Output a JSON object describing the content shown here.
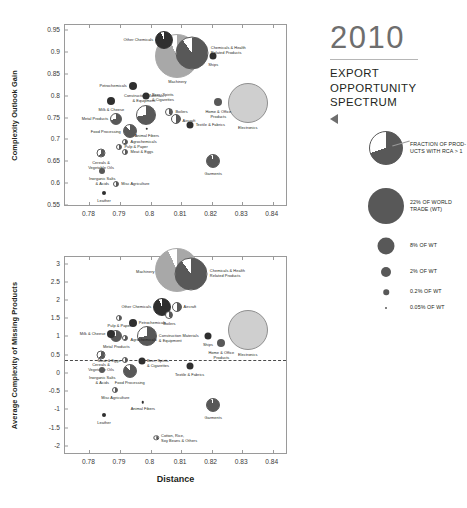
{
  "panel": {
    "year": "2010",
    "subtitle_lines": [
      "EXPORT",
      "OPPORTUNITY",
      "SPECTRUM"
    ],
    "arrow_icon": "triangle-left-icon"
  },
  "legend": {
    "items": [
      {
        "label": "FRACTION OF PROD-\nUCTS WITH RCA > 1",
        "kind": "pie",
        "size": 34
      },
      {
        "label": "22% OF WORLD\nTRADE (WT)",
        "kind": "circle",
        "size": 36
      },
      {
        "label": "8% OF WT",
        "kind": "circle",
        "size": 17
      },
      {
        "label": "2% OF WT",
        "kind": "circle",
        "size": 10
      },
      {
        "label": "0.2% OF WT",
        "kind": "circle",
        "size": 5.5
      },
      {
        "label": "0.05% OF WT",
        "kind": "circle",
        "size": 2
      }
    ]
  },
  "colors": {
    "dark": "#2f2f2f",
    "mid": "#585858",
    "light": "#a8a8a8",
    "pale": "#cfcfcf",
    "axis": "#9a9a9a",
    "text": "#231f20",
    "year": "#6e6e6e"
  },
  "chart_data": [
    {
      "type": "scatter",
      "id": "complexity-outlook-gain",
      "title": "",
      "xlabel": "",
      "ylabel": "Complexity Outlook Gain",
      "xlim": [
        0.772,
        0.845
      ],
      "ylim": [
        0.545,
        0.962
      ],
      "xticks": [
        0.78,
        0.79,
        0.8,
        0.81,
        0.82,
        0.83,
        0.84
      ],
      "xticklabels": [
        "0.78",
        "0.79",
        "0.8",
        "0.81",
        "0.82",
        "0.83",
        "0.84"
      ],
      "yticks": [
        0.55,
        0.6,
        0.65,
        0.7,
        0.75,
        0.8,
        0.85,
        0.9,
        0.95
      ],
      "yticklabels": [
        "0.55",
        "0.6",
        "0.65",
        "0.7",
        "0.75",
        "0.8",
        "0.85",
        "0.9",
        "0.95"
      ],
      "grid": false,
      "legend": "right",
      "points": [
        {
          "name": "Other Chemicals",
          "x": 0.8045,
          "y": 0.9285,
          "size": 18,
          "frac": 0.94,
          "shade": "dark",
          "lpos": "lt",
          "ldx": -11,
          "ldy": 0
        },
        {
          "name": "Machinery",
          "x": 0.8088,
          "y": 0.8915,
          "size": 44,
          "frac": 0.93,
          "shade": "light",
          "lpos": "bt",
          "ldx": 0,
          "ldy": 24
        },
        {
          "name": "Chemicals & Health\nRelated Products",
          "x": 0.8135,
          "y": 0.8985,
          "size": 33,
          "frac": 0.9,
          "shade": "mid",
          "lpos": "rt",
          "ldx": 19,
          "ldy": -2
        },
        {
          "name": "Ships",
          "x": 0.8205,
          "y": 0.8905,
          "size": 7,
          "frac": 1.0,
          "shade": "dark",
          "lpos": "bt",
          "ldx": 0,
          "ldy": 7
        },
        {
          "name": "Petrochemicals",
          "x": 0.7942,
          "y": 0.8225,
          "size": 8,
          "frac": 1.0,
          "shade": "dark",
          "lpos": "lt",
          "ldx": -6,
          "ldy": 0
        },
        {
          "name": "Beer, Spirits\n& Cigarettes",
          "x": 0.7985,
          "y": 0.7985,
          "size": 7,
          "frac": 1.0,
          "shade": "dark",
          "lpos": "rt",
          "ldx": 6,
          "ldy": 2
        },
        {
          "name": "Home & Office\nProducts",
          "x": 0.8222,
          "y": 0.7845,
          "size": 8,
          "frac": 1.0,
          "shade": "mid",
          "lpos": "bt",
          "ldx": 0,
          "ldy": 8
        },
        {
          "name": "Electronics",
          "x": 0.8318,
          "y": 0.7825,
          "size": 40,
          "frac": 1.0,
          "shade": "pale",
          "lpos": "bt",
          "ldx": 0,
          "ldy": 23
        },
        {
          "name": "Milk & Cheese",
          "x": 0.7872,
          "y": 0.7872,
          "size": 8,
          "frac": 1.0,
          "shade": "dark",
          "lpos": "bt",
          "ldx": 0,
          "ldy": 7
        },
        {
          "name": "Construction Materials\n& Equipment",
          "x": 0.7985,
          "y": 0.7555,
          "size": 20,
          "frac": 0.72,
          "shade": "mid",
          "lpos": "tp",
          "ldx": -2,
          "ldy": -11
        },
        {
          "name": "Boilers",
          "x": 0.8062,
          "y": 0.7638,
          "size": 8,
          "frac": 0.45,
          "shade": "mid",
          "lpos": "rt",
          "ldx": 6,
          "ldy": 0
        },
        {
          "name": "Metal Products",
          "x": 0.7888,
          "y": 0.7462,
          "size": 12,
          "frac": 0.72,
          "shade": "mid",
          "lpos": "lt",
          "ldx": -8,
          "ldy": 0
        },
        {
          "name": "Aircraft",
          "x": 0.8082,
          "y": 0.7472,
          "size": 10,
          "frac": 0.52,
          "shade": "mid",
          "lpos": "rt",
          "ldx": 7,
          "ldy": 2
        },
        {
          "name": "Textile & Fabrics",
          "x": 0.8128,
          "y": 0.7338,
          "size": 7,
          "frac": 1.0,
          "shade": "dark",
          "lpos": "rt",
          "ldx": 6,
          "ldy": 0
        },
        {
          "name": "Food Processing",
          "x": 0.7932,
          "y": 0.7188,
          "size": 14,
          "frac": 0.88,
          "shade": "mid",
          "lpos": "lt",
          "ldx": -9,
          "ldy": 1
        },
        {
          "name": "Animal Fibers",
          "x": 0.7988,
          "y": 0.7238,
          "size": 2.5,
          "frac": 1.0,
          "shade": "dark",
          "lpos": "bt",
          "ldx": 0,
          "ldy": 5
        },
        {
          "name": "Agrochemicals",
          "x": 0.7918,
          "y": 0.6938,
          "size": 6,
          "frac": 0.6,
          "shade": "mid",
          "lpos": "rt",
          "ldx": 5,
          "ldy": 0
        },
        {
          "name": "Pulp & Paper",
          "x": 0.7898,
          "y": 0.6822,
          "size": 6,
          "frac": 0.5,
          "shade": "mid",
          "lpos": "rt",
          "ldx": 5,
          "ldy": 0
        },
        {
          "name": "Meat & Eggs",
          "x": 0.7918,
          "y": 0.6712,
          "size": 6,
          "frac": 0.55,
          "shade": "mid",
          "lpos": "rt",
          "ldx": 5,
          "ldy": 0
        },
        {
          "name": "Cereals &\nVegetable Oils",
          "x": 0.7838,
          "y": 0.6688,
          "size": 9,
          "frac": 0.6,
          "shade": "mid",
          "lpos": "bt",
          "ldx": 0,
          "ldy": 8
        },
        {
          "name": "Inorganic Salts\n& Acids",
          "x": 0.7842,
          "y": 0.6272,
          "size": 6,
          "frac": 1.0,
          "shade": "mid",
          "lpos": "bt",
          "ldx": 0,
          "ldy": 6
        },
        {
          "name": "Misc Agriculture",
          "x": 0.7888,
          "y": 0.5988,
          "size": 6,
          "frac": 0.55,
          "shade": "mid",
          "lpos": "rt",
          "ldx": 5,
          "ldy": 0
        },
        {
          "name": "Leather",
          "x": 0.7848,
          "y": 0.5782,
          "size": 4,
          "frac": 1.0,
          "shade": "dark",
          "lpos": "bt",
          "ldx": 0,
          "ldy": 6
        },
        {
          "name": "Garments",
          "x": 0.8205,
          "y": 0.6512,
          "size": 14,
          "frac": 0.95,
          "shade": "mid",
          "lpos": "bt",
          "ldx": 0,
          "ldy": 11
        }
      ]
    },
    {
      "type": "scatter",
      "id": "average-complexity-of-missing-products",
      "title": "",
      "xlabel": "Distance",
      "ylabel": "Average Complexity of Missing Products",
      "xlim": [
        0.772,
        0.845
      ],
      "ylim": [
        -2.25,
        3.18
      ],
      "xticks": [
        0.78,
        0.79,
        0.8,
        0.81,
        0.82,
        0.83,
        0.84
      ],
      "xticklabels": [
        "0.78",
        "0.79",
        "0.8",
        "0.81",
        "0.82",
        "0.83",
        "0.84"
      ],
      "yticks": [
        -2,
        -1.5,
        -1,
        -0.5,
        0,
        0.5,
        1,
        1.5,
        2,
        2.5,
        3
      ],
      "yticklabels": [
        "-2",
        "-1.5",
        "-1",
        "-0.5",
        "0",
        "0.5",
        "1",
        "1.5",
        "2",
        "2.5",
        "3"
      ],
      "grid": false,
      "hline": 0.35,
      "points": [
        {
          "name": "Machinery",
          "x": 0.8085,
          "y": 2.82,
          "size": 44,
          "frac": 0.93,
          "shade": "light",
          "lpos": "lt",
          "ldx": -22,
          "ldy": 2
        },
        {
          "name": "Chemicals & Health\nRelated Products",
          "x": 0.8132,
          "y": 2.72,
          "size": 33,
          "frac": 0.9,
          "shade": "mid",
          "lpos": "rt",
          "ldx": 19,
          "ldy": 0
        },
        {
          "name": "Other Chemicals",
          "x": 0.8038,
          "y": 1.82,
          "size": 18,
          "frac": 0.94,
          "shade": "dark",
          "lpos": "lt",
          "ldx": -11,
          "ldy": 0
        },
        {
          "name": "Aircraft",
          "x": 0.8085,
          "y": 1.8,
          "size": 10,
          "frac": 0.52,
          "shade": "mid",
          "lpos": "rt",
          "ldx": 7,
          "ldy": 0
        },
        {
          "name": "Boilers",
          "x": 0.8062,
          "y": 1.6,
          "size": 8,
          "frac": 0.45,
          "shade": "mid",
          "lpos": "bt",
          "ldx": 0,
          "ldy": 7
        },
        {
          "name": "Pulp & Paper",
          "x": 0.7898,
          "y": 1.52,
          "size": 6,
          "frac": 0.5,
          "shade": "mid",
          "lpos": "bt",
          "ldx": 0,
          "ldy": 6
        },
        {
          "name": "Petrochemicals",
          "x": 0.7942,
          "y": 1.38,
          "size": 8,
          "frac": 1.0,
          "shade": "dark",
          "lpos": "rt",
          "ldx": 6,
          "ldy": 0
        },
        {
          "name": "Milk & Cheese",
          "x": 0.7872,
          "y": 1.08,
          "size": 8,
          "frac": 1.0,
          "shade": "dark",
          "lpos": "lt",
          "ldx": -6,
          "ldy": 0
        },
        {
          "name": "Metal Products",
          "x": 0.7888,
          "y": 1.0,
          "size": 12,
          "frac": 0.72,
          "shade": "mid",
          "lpos": "bt",
          "ldx": 0,
          "ldy": 9
        },
        {
          "name": "Agrochemicals",
          "x": 0.7918,
          "y": 0.96,
          "size": 6,
          "frac": 0.6,
          "shade": "mid",
          "lpos": "rt",
          "ldx": 5,
          "ldy": 2
        },
        {
          "name": "Construction Materials\n& Equipment",
          "x": 0.7988,
          "y": 1.02,
          "size": 20,
          "frac": 0.72,
          "shade": "mid",
          "lpos": "rt",
          "ldx": 12,
          "ldy": 3
        },
        {
          "name": "Ships",
          "x": 0.8188,
          "y": 1.02,
          "size": 7,
          "frac": 1.0,
          "shade": "dark",
          "lpos": "bt",
          "ldx": 0,
          "ldy": 7
        },
        {
          "name": "Home & Office\nProducts",
          "x": 0.8232,
          "y": 0.82,
          "size": 8,
          "frac": 1.0,
          "shade": "mid",
          "lpos": "bt",
          "ldx": 0,
          "ldy": 8
        },
        {
          "name": "Electronics",
          "x": 0.8318,
          "y": 1.18,
          "size": 40,
          "frac": 1.0,
          "shade": "pale",
          "lpos": "bt",
          "ldx": 0,
          "ldy": 23
        },
        {
          "name": "Cereals &\nVegetable Oils",
          "x": 0.7838,
          "y": 0.48,
          "size": 9,
          "frac": 0.6,
          "shade": "mid",
          "lpos": "bt",
          "ldx": 0,
          "ldy": 8
        },
        {
          "name": "Meat & Eggs",
          "x": 0.7918,
          "y": 0.35,
          "size": 6,
          "frac": 0.55,
          "shade": "mid",
          "lpos": "lt",
          "ldx": -5,
          "ldy": 1
        },
        {
          "name": "Beer, Spirits\n& Cigarettes",
          "x": 0.7972,
          "y": 0.33,
          "size": 7,
          "frac": 1.0,
          "shade": "dark",
          "lpos": "rt",
          "ldx": 5,
          "ldy": 3
        },
        {
          "name": "Textile & Fabrics",
          "x": 0.8128,
          "y": 0.18,
          "size": 7,
          "frac": 1.0,
          "shade": "dark",
          "lpos": "bt",
          "ldx": 0,
          "ldy": 7
        },
        {
          "name": "Inorganic Salts\n& Acids",
          "x": 0.7842,
          "y": 0.08,
          "size": 6,
          "frac": 1.0,
          "shade": "mid",
          "lpos": "bt",
          "ldx": 0,
          "ldy": 6
        },
        {
          "name": "Food Processing",
          "x": 0.7932,
          "y": 0.06,
          "size": 14,
          "frac": 0.88,
          "shade": "mid",
          "lpos": "bt",
          "ldx": 0,
          "ldy": 10
        },
        {
          "name": "Misc Agriculture",
          "x": 0.7885,
          "y": -0.48,
          "size": 6,
          "frac": 0.55,
          "shade": "mid",
          "lpos": "bt",
          "ldx": 0,
          "ldy": 6
        },
        {
          "name": "Animal Fibers",
          "x": 0.7975,
          "y": -0.8,
          "size": 2.5,
          "frac": 1.0,
          "shade": "dark",
          "lpos": "bt",
          "ldx": 0,
          "ldy": 5
        },
        {
          "name": "Garments",
          "x": 0.8205,
          "y": -0.88,
          "size": 14,
          "frac": 0.95,
          "shade": "mid",
          "lpos": "bt",
          "ldx": 0,
          "ldy": 11
        },
        {
          "name": "Leather",
          "x": 0.7848,
          "y": -1.16,
          "size": 4,
          "frac": 1.0,
          "shade": "dark",
          "lpos": "bt",
          "ldx": 0,
          "ldy": 6
        },
        {
          "name": "Cotton, Rice,\nSoy Beans & Others",
          "x": 0.8018,
          "y": -1.78,
          "size": 5.5,
          "frac": 0.55,
          "shade": "mid",
          "lpos": "rt",
          "ldx": 5,
          "ldy": 1
        }
      ]
    }
  ]
}
